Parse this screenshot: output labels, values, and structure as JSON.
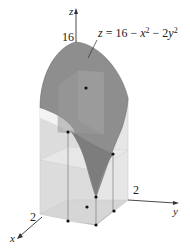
{
  "figure": {
    "type": "3d-surface-diagram",
    "surface_equation": {
      "lhs": "z",
      "eq": " = 16 − ",
      "t1": "x",
      "t1_exp": "2",
      "mid": " − 2",
      "t2": "y",
      "t2_exp": "2"
    },
    "axes": {
      "z": {
        "label": "z",
        "tick": "16"
      },
      "x": {
        "label": "x",
        "tick": "2"
      },
      "y": {
        "label": "y",
        "tick": "2"
      }
    },
    "colors": {
      "surface": "#8c8c8c",
      "surface_dark": "#7a7a7a",
      "box_light": "#e3e3e3",
      "box_mid": "#d2d2d2",
      "inner_box": "#9a9a9a",
      "axis": "#333333",
      "dot": "#111111"
    },
    "sample_points_count": 8
  }
}
